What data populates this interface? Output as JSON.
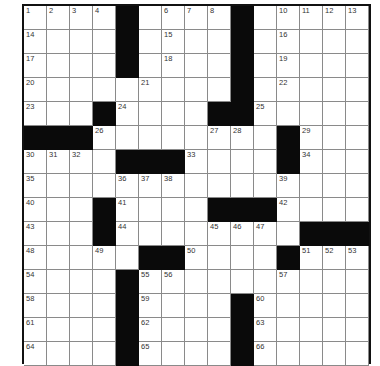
{
  "puzzle": {
    "rows": 15,
    "cols": 15,
    "colors": {
      "block": "#0a0a0a",
      "cell": "#ffffff",
      "gridline": "#8a8a8a",
      "border": "#111111",
      "number": "#333333"
    },
    "layout": [
      "....#....#.....",
      "....#....#.....",
      "....#....#.....",
      ".........#.....",
      "...#....##.....",
      "###........#...",
      "....###....#...",
      "...............",
      "...#....###....",
      "...#........###",
      ".....##....#...",
      "....#..........",
      "....#....#.....",
      "....#....#.....",
      "....#....#....."
    ],
    "numbers": [
      [
        1,
        2,
        3,
        4,
        5,
        0,
        6,
        7,
        8,
        9,
        0,
        10,
        11,
        12,
        13
      ],
      [
        14,
        0,
        0,
        0,
        0,
        0,
        15,
        0,
        0,
        0,
        0,
        16,
        0,
        0,
        0
      ],
      [
        17,
        0,
        0,
        0,
        0,
        0,
        18,
        0,
        0,
        0,
        0,
        19,
        0,
        0,
        0
      ],
      [
        20,
        0,
        0,
        0,
        0,
        21,
        0,
        0,
        0,
        0,
        0,
        22,
        0,
        0,
        0
      ],
      [
        23,
        0,
        0,
        0,
        24,
        0,
        0,
        0,
        0,
        0,
        25,
        0,
        0,
        0,
        0
      ],
      [
        0,
        0,
        0,
        26,
        0,
        0,
        0,
        0,
        27,
        28,
        0,
        0,
        29,
        0,
        0
      ],
      [
        30,
        31,
        32,
        0,
        0,
        0,
        0,
        33,
        0,
        0,
        0,
        0,
        34,
        0,
        0
      ],
      [
        35,
        0,
        0,
        0,
        36,
        37,
        38,
        0,
        0,
        0,
        0,
        39,
        0,
        0,
        0
      ],
      [
        40,
        0,
        0,
        0,
        41,
        0,
        0,
        0,
        0,
        0,
        0,
        42,
        0,
        0,
        0
      ],
      [
        43,
        0,
        0,
        0,
        44,
        0,
        0,
        0,
        45,
        46,
        47,
        0,
        0,
        0,
        0
      ],
      [
        48,
        0,
        0,
        49,
        0,
        0,
        0,
        50,
        0,
        0,
        0,
        0,
        51,
        52,
        53
      ],
      [
        54,
        0,
        0,
        0,
        0,
        55,
        56,
        0,
        0,
        0,
        0,
        57,
        0,
        0,
        0
      ],
      [
        58,
        0,
        0,
        0,
        0,
        59,
        0,
        0,
        0,
        0,
        60,
        0,
        0,
        0,
        0
      ],
      [
        61,
        0,
        0,
        0,
        0,
        62,
        0,
        0,
        0,
        0,
        63,
        0,
        0,
        0,
        0
      ],
      [
        64,
        0,
        0,
        0,
        0,
        65,
        0,
        0,
        0,
        0,
        66,
        0,
        0,
        0,
        0
      ]
    ]
  }
}
